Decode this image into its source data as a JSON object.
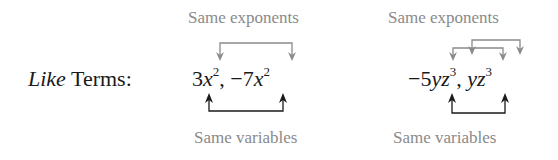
{
  "label": {
    "italic": "Like",
    "rest": " Terms:"
  },
  "top_caption_left": "Same exponents",
  "top_caption_right": "Same exponents",
  "bottom_caption_left": "Same variables",
  "bottom_caption_right": "Same variables",
  "example1": {
    "t1_coef": "3",
    "t1_var": "x",
    "t1_exp": "2",
    "sep": ", ",
    "t2_coef": "−7",
    "t2_var": "x",
    "t2_exp": "2"
  },
  "example2": {
    "t1_coef": "−5",
    "t1_var": "yz",
    "t1_exp": "3",
    "sep": ", ",
    "t2_var": "yz",
    "t2_exp": "3"
  },
  "colors": {
    "arrow_gray": "#8a8a8a",
    "arrow_black": "#1a1a1a",
    "caption": "#8a8a8a"
  }
}
